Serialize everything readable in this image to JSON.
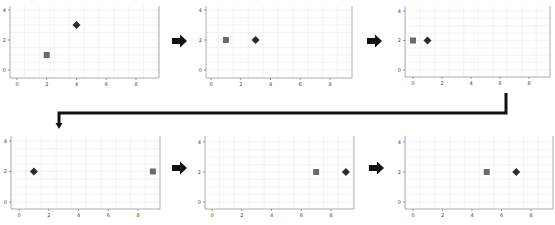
{
  "diagram": {
    "colors": {
      "square": "#6b6b6b",
      "diamond": "#2b2b2b",
      "arrow": "#111111",
      "grid": "#ececec",
      "axis": "#9a9a9a"
    },
    "x_ticks": [
      "0",
      "2",
      "4",
      "6",
      "8"
    ],
    "y_ticks": [
      "0",
      "2",
      "4"
    ],
    "panels": [
      {
        "id": 1,
        "square": {
          "x": 2,
          "y": 1
        },
        "diamond": {
          "x": 4,
          "y": 3
        }
      },
      {
        "id": 2,
        "square": {
          "x": 1,
          "y": 2
        },
        "diamond": {
          "x": 3,
          "y": 2
        }
      },
      {
        "id": 3,
        "square": {
          "x": 0,
          "y": 2
        },
        "diamond": {
          "x": 1,
          "y": 2
        }
      },
      {
        "id": 4,
        "square": {
          "x": 9,
          "y": 2
        },
        "diamond": {
          "x": 1,
          "y": 2
        }
      },
      {
        "id": 5,
        "square": {
          "x": 7,
          "y": 2
        },
        "diamond": {
          "x": 9,
          "y": 2
        }
      },
      {
        "id": 6,
        "square": {
          "x": 5,
          "y": 2
        },
        "diamond": {
          "x": 7,
          "y": 2
        }
      }
    ],
    "arrows": [
      {
        "from": 1,
        "to": 2,
        "type": "block-right"
      },
      {
        "from": 2,
        "to": 3,
        "type": "block-right"
      },
      {
        "from": 3,
        "to": 4,
        "type": "elbow-connector"
      },
      {
        "from": 4,
        "to": 5,
        "type": "block-right"
      },
      {
        "from": 5,
        "to": 6,
        "type": "block-right"
      }
    ]
  },
  "chart_data": [
    {
      "type": "scatter",
      "title": "",
      "xlabel": "",
      "ylabel": "",
      "xlim": [
        -0.5,
        9.5
      ],
      "ylim": [
        -0.5,
        4.2
      ],
      "grid": true,
      "series": [
        {
          "name": "square",
          "x": [
            2
          ],
          "y": [
            1
          ]
        },
        {
          "name": "diamond",
          "x": [
            4
          ],
          "y": [
            3
          ]
        }
      ]
    },
    {
      "type": "scatter",
      "title": "",
      "xlabel": "",
      "ylabel": "",
      "xlim": [
        -0.5,
        9.5
      ],
      "ylim": [
        -0.5,
        4.2
      ],
      "grid": true,
      "series": [
        {
          "name": "square",
          "x": [
            1
          ],
          "y": [
            2
          ]
        },
        {
          "name": "diamond",
          "x": [
            3
          ],
          "y": [
            2
          ]
        }
      ]
    },
    {
      "type": "scatter",
      "title": "",
      "xlabel": "",
      "ylabel": "",
      "xlim": [
        -0.5,
        9.5
      ],
      "ylim": [
        -0.5,
        4.2
      ],
      "grid": true,
      "series": [
        {
          "name": "square",
          "x": [
            0
          ],
          "y": [
            2
          ]
        },
        {
          "name": "diamond",
          "x": [
            1
          ],
          "y": [
            2
          ]
        }
      ]
    },
    {
      "type": "scatter",
      "title": "",
      "xlabel": "",
      "ylabel": "",
      "xlim": [
        -0.5,
        9.5
      ],
      "ylim": [
        -0.5,
        4.2
      ],
      "grid": true,
      "series": [
        {
          "name": "square",
          "x": [
            9
          ],
          "y": [
            2
          ]
        },
        {
          "name": "diamond",
          "x": [
            1
          ],
          "y": [
            2
          ]
        }
      ]
    },
    {
      "type": "scatter",
      "title": "",
      "xlabel": "",
      "ylabel": "",
      "xlim": [
        -0.5,
        9.5
      ],
      "ylim": [
        -0.5,
        4.2
      ],
      "grid": true,
      "series": [
        {
          "name": "square",
          "x": [
            7
          ],
          "y": [
            2
          ]
        },
        {
          "name": "diamond",
          "x": [
            9
          ],
          "y": [
            2
          ]
        }
      ]
    },
    {
      "type": "scatter",
      "title": "",
      "xlabel": "",
      "ylabel": "",
      "xlim": [
        -0.5,
        9.5
      ],
      "ylim": [
        -0.5,
        4.2
      ],
      "grid": true,
      "series": [
        {
          "name": "square",
          "x": [
            5
          ],
          "y": [
            2
          ]
        },
        {
          "name": "diamond",
          "x": [
            7
          ],
          "y": [
            2
          ]
        }
      ]
    }
  ]
}
